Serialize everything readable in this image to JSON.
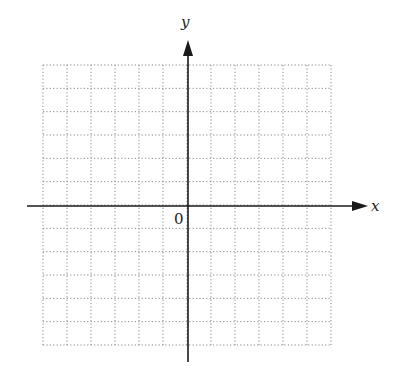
{
  "diagram": {
    "type": "coordinate-grid",
    "axes": {
      "x_label": "x",
      "y_label": "y",
      "origin_label": "0"
    },
    "grid": {
      "columns": 12,
      "rows": 12,
      "line_style": "dotted",
      "line_color": "#8a8a8a"
    },
    "axis_color": "#1a1a1a"
  }
}
